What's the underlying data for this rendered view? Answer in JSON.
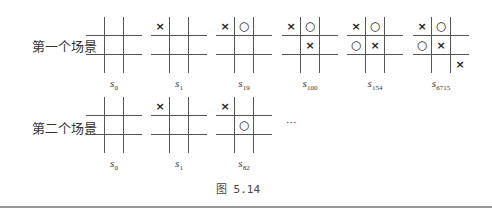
{
  "rows": [
    {
      "label": "第一个场景",
      "boards": [
        {
          "state": "s",
          "sub": "0",
          "cells": [
            "",
            "",
            "",
            "",
            "",
            "",
            "",
            "",
            ""
          ]
        },
        {
          "state": "s",
          "sub": "1",
          "cells": [
            "×",
            "",
            "",
            "",
            "",
            "",
            "",
            "",
            ""
          ]
        },
        {
          "state": "s",
          "sub": "19",
          "cells": [
            "×",
            "○",
            "",
            "",
            "",
            "",
            "",
            "",
            ""
          ]
        },
        {
          "state": "s",
          "sub": "100",
          "cells": [
            "×",
            "○",
            "",
            "",
            "×",
            "",
            "",
            "",
            ""
          ]
        },
        {
          "state": "s",
          "sub": "154",
          "cells": [
            "×",
            "○",
            "",
            "○",
            "×",
            "",
            "",
            "",
            ""
          ]
        },
        {
          "state": "s",
          "sub": "6715",
          "cells": [
            "×",
            "○",
            "",
            "○",
            "×",
            "",
            "",
            "",
            "×"
          ]
        }
      ]
    },
    {
      "label": "第二个场景",
      "boards": [
        {
          "state": "s",
          "sub": "0",
          "cells": [
            "",
            "",
            "",
            "",
            "",
            "",
            "",
            "",
            ""
          ]
        },
        {
          "state": "s",
          "sub": "1",
          "cells": [
            "×",
            "",
            "",
            "",
            "",
            "",
            "",
            "",
            ""
          ]
        },
        {
          "state": "s",
          "sub": "82",
          "cells": [
            "×",
            "",
            "",
            "",
            "○",
            "",
            "",
            "",
            ""
          ]
        }
      ],
      "ellipsis": "···"
    }
  ],
  "caption": "图  5.14"
}
